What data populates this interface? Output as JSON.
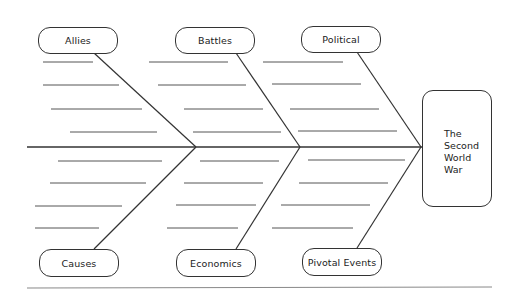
{
  "diagram": {
    "type": "fishbone",
    "effect": {
      "label": "The Second World War",
      "lines": [
        "The",
        "Second",
        "World",
        "War"
      ]
    },
    "categories": {
      "top": [
        {
          "label": "Allies",
          "blank_lines": 4
        },
        {
          "label": "Battles",
          "blank_lines": 4
        },
        {
          "label": "Political",
          "blank_lines": 4
        }
      ],
      "bottom": [
        {
          "label": "Causes",
          "blank_lines": 4
        },
        {
          "label": "Economics",
          "blank_lines": 4
        },
        {
          "label": "Pivotal Events",
          "blank_lines": 4
        }
      ]
    },
    "colors": {
      "stroke": "#333333",
      "blank_line": "#555555",
      "rule": "#888888",
      "background": "#ffffff"
    }
  }
}
